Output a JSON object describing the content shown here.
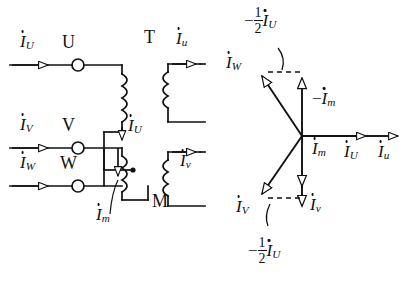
{
  "figure": {
    "type": "electrical-schematic-and-phasor-diagram",
    "left_panel": {
      "name": "three-phase-transformer-circuit",
      "transformer_label": "T",
      "machine_label": "M",
      "terminals": [
        {
          "name": "U",
          "label": "U",
          "y": 65
        },
        {
          "name": "V",
          "label": "V",
          "y": 148
        },
        {
          "name": "W",
          "label": "W",
          "y": 186
        }
      ],
      "input_currents": [
        {
          "symbol": "I",
          "sub": "U",
          "y": 65
        },
        {
          "symbol": "I",
          "sub": "V",
          "y": 148
        },
        {
          "symbol": "I",
          "sub": "W",
          "y": 186
        }
      ],
      "branch_current": {
        "symbol": "I",
        "sub": "U"
      },
      "magnetizing_current": {
        "symbol": "I",
        "sub": "m"
      },
      "output_currents": [
        {
          "symbol": "I",
          "sub": "u"
        },
        {
          "symbol": "I",
          "sub": "v"
        }
      ]
    },
    "right_panel": {
      "name": "phasor-diagram",
      "origin": {
        "x": 302,
        "y": 136
      },
      "phasors": [
        {
          "name": "I_U",
          "symbol": "I",
          "sub": "U",
          "angle_deg": 0,
          "label_x": 352,
          "label_y": 150
        },
        {
          "name": "I_u",
          "symbol": "I",
          "sub": "u",
          "angle_deg": 0,
          "label_x": 382,
          "label_y": 150
        },
        {
          "name": "I_W",
          "symbol": "I",
          "sub": "W",
          "angle_deg": 125,
          "label_x": 236,
          "label_y": 58
        },
        {
          "name": "I_V",
          "symbol": "I",
          "sub": "V",
          "angle_deg": -125,
          "label_x": 237,
          "label_y": 200
        },
        {
          "name": "-I_m",
          "prefix": "−",
          "symbol": "I",
          "sub": "m",
          "angle_deg": 90,
          "label_x": 312,
          "label_y": 96
        },
        {
          "name": "I_m",
          "symbol": "I",
          "sub": "m",
          "angle_deg": -90,
          "label_x": 312,
          "label_y": 148
        },
        {
          "name": "I_v",
          "symbol": "I",
          "sub": "v",
          "angle_deg": -90,
          "label_x": 312,
          "label_y": 196
        }
      ],
      "projection_labels": [
        {
          "name": "top-half-IU",
          "prefix": "−",
          "num": "1",
          "den": "2",
          "symbol": "I",
          "sub": "U",
          "x": 244,
          "y": 8
        },
        {
          "name": "bottom-half-IU",
          "prefix": "−",
          "num": "1",
          "den": "2",
          "symbol": "I",
          "sub": "U",
          "x": 248,
          "y": 238
        }
      ]
    }
  },
  "style": {
    "stroke": "#111111",
    "background": "#ffffff"
  }
}
